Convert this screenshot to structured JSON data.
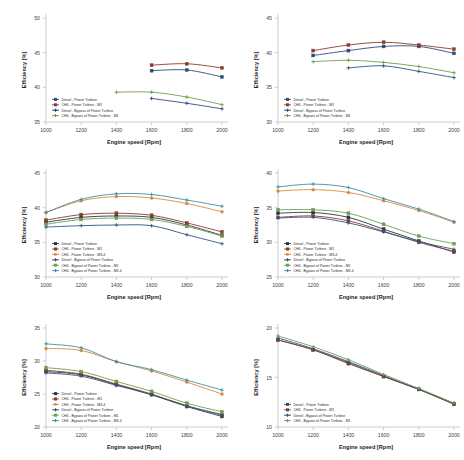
{
  "figure": {
    "background": "#ffffff",
    "panel_count": 6,
    "shared_xlabel": "Engine speed [Rpm]",
    "shared_ylabel": "Efficiency [%]",
    "x_ticks": [
      1000,
      1200,
      1400,
      1600,
      1800,
      2000
    ],
    "series_colors": {
      "diesel_power_turbine": "#2f4a7c",
      "ch4_power_turbine_m1": "#8c3a2b",
      "ch4_power_turbine_m34": "#d98a3a",
      "diesel_bypass": "#31567f",
      "ch4_bypass_m1": "#6f9e4c",
      "ch4_bypass_m34": "#3f8fa8",
      "dark_navy": "#22364f"
    }
  },
  "chart_data": [
    {
      "id": "panel-1",
      "position": "top-left",
      "type": "line",
      "title": "",
      "xlabel": "Engine speed [Rpm]",
      "ylabel": "Efficiency [%]",
      "xlim": [
        1000,
        2000
      ],
      "ylim": [
        35,
        50
      ],
      "x_ticks": [
        1000,
        1200,
        1400,
        1600,
        1800,
        2000
      ],
      "y_ticks": [
        35,
        40,
        45,
        50
      ],
      "grid": false,
      "legend_position": "lower-left",
      "series": [
        {
          "name": "Diesel - Power Turbine",
          "color": "#2f4a7c",
          "marker": "square",
          "x": [
            1600,
            1800,
            2000
          ],
          "values": [
            42.4,
            42.5,
            41.5
          ]
        },
        {
          "name": "CH4 - Power Turbine - M1",
          "color": "#8c3a2b",
          "marker": "square",
          "x": [
            1600,
            1800,
            2000
          ],
          "values": [
            43.2,
            43.4,
            42.8
          ]
        },
        {
          "name": "Diesel - Bypass of Power Turbine",
          "color": "#2f4a7c",
          "marker": "cross",
          "x": [
            1600,
            1800,
            2000
          ],
          "values": [
            38.4,
            37.7,
            36.9
          ]
        },
        {
          "name": "CH4 - Bypass of Power Turbine - M1",
          "color": "#6f9e4c",
          "marker": "cross",
          "x": [
            1400,
            1600,
            1800,
            2000
          ],
          "values": [
            39.3,
            39.3,
            38.6,
            37.5
          ]
        }
      ]
    },
    {
      "id": "panel-2",
      "position": "top-right",
      "type": "line",
      "title": "",
      "xlabel": "Engine speed [Rpm]",
      "ylabel": "Efficiency [%]",
      "xlim": [
        1000,
        2000
      ],
      "ylim": [
        30,
        45
      ],
      "x_ticks": [
        1000,
        1200,
        1400,
        1600,
        1800,
        2000
      ],
      "y_ticks": [
        30,
        35,
        40,
        45
      ],
      "grid": false,
      "legend_position": "lower-left",
      "series": [
        {
          "name": "Diesel - Power Turbine",
          "color": "#2f4a7c",
          "marker": "square",
          "x": [
            1200,
            1400,
            1600,
            1800,
            2000
          ],
          "values": [
            39.6,
            40.3,
            40.9,
            40.9,
            39.9
          ]
        },
        {
          "name": "CH4 - Power Turbine - M1",
          "color": "#8c3a2b",
          "marker": "square",
          "x": [
            1200,
            1400,
            1600,
            1800,
            2000
          ],
          "values": [
            40.3,
            41.1,
            41.5,
            41.1,
            40.5
          ]
        },
        {
          "name": "Diesel - Bypass of Power Turbine",
          "color": "#31567f",
          "marker": "cross",
          "x": [
            1400,
            1600,
            1800,
            2000
          ],
          "values": [
            37.8,
            38.1,
            37.3,
            36.4
          ]
        },
        {
          "name": "CH4 - Bypass of Power Turbine - M1",
          "color": "#6f9e4c",
          "marker": "cross",
          "x": [
            1200,
            1400,
            1600,
            1800,
            2000
          ],
          "values": [
            38.7,
            38.9,
            38.6,
            38.0,
            37.1
          ]
        }
      ]
    },
    {
      "id": "panel-3",
      "position": "middle-left",
      "type": "line",
      "title": "",
      "xlabel": "Engine speed [Rpm]",
      "ylabel": "Efficiency [%]",
      "xlim": [
        1000,
        2000
      ],
      "ylim": [
        30,
        45
      ],
      "x_ticks": [
        1000,
        1200,
        1400,
        1600,
        1800,
        2000
      ],
      "y_ticks": [
        30,
        35,
        40,
        45
      ],
      "grid": false,
      "legend_position": "lower-left",
      "series": [
        {
          "name": "Diesel - Power Turbine",
          "color": "#22364f",
          "marker": "square",
          "x": [
            1000,
            1200,
            1400,
            1600,
            1800,
            2000
          ],
          "values": [
            37.9,
            38.6,
            38.8,
            38.6,
            37.5,
            36.0
          ]
        },
        {
          "name": "CH4 - Power Turbine - M1",
          "color": "#8c3a2b",
          "marker": "square",
          "x": [
            1000,
            1200,
            1400,
            1600,
            1800,
            2000
          ],
          "values": [
            38.2,
            39.0,
            39.2,
            38.9,
            37.8,
            36.5
          ]
        },
        {
          "name": "CH4 - Power Turbine - M3-4",
          "color": "#d98a3a",
          "marker": "circle",
          "x": [
            1000,
            1200,
            1400,
            1600,
            1800,
            2000
          ],
          "values": [
            39.3,
            41.0,
            41.6,
            41.4,
            40.6,
            39.4
          ]
        },
        {
          "name": "Diesel - Bypass of Power Turbine",
          "color": "#31567f",
          "marker": "cross",
          "x": [
            1000,
            1200,
            1400,
            1600,
            1800,
            2000
          ],
          "values": [
            37.2,
            37.4,
            37.5,
            37.4,
            36.1,
            34.8
          ]
        },
        {
          "name": "CH4 - Bypass of Power Turbine - M1",
          "color": "#6f9e4c",
          "marker": "square",
          "x": [
            1000,
            1200,
            1400,
            1600,
            1800,
            2000
          ],
          "values": [
            37.6,
            38.3,
            38.5,
            38.3,
            37.3,
            35.9
          ]
        },
        {
          "name": "CH4 - Bypass of Power Turbine - M3-4",
          "color": "#3f8fa8",
          "marker": "cross",
          "x": [
            1000,
            1200,
            1400,
            1600,
            1800,
            2000
          ],
          "values": [
            39.3,
            41.2,
            42.0,
            41.9,
            41.1,
            40.2
          ]
        }
      ]
    },
    {
      "id": "panel-4",
      "position": "middle-right",
      "type": "line",
      "title": "",
      "xlabel": "Engine speed [Rpm]",
      "ylabel": "Efficiency [%]",
      "xlim": [
        1000,
        2000
      ],
      "ylim": [
        25,
        40
      ],
      "x_ticks": [
        1000,
        1200,
        1400,
        1600,
        1800,
        2000
      ],
      "y_ticks": [
        25,
        30,
        35,
        40
      ],
      "grid": false,
      "legend_position": "lower-left",
      "series": [
        {
          "name": "Diesel - Power Turbine",
          "color": "#22364f",
          "marker": "square",
          "x": [
            1000,
            1200,
            1400,
            1600,
            1800,
            2000
          ],
          "values": [
            34.2,
            34.3,
            33.6,
            31.9,
            30.2,
            28.6
          ]
        },
        {
          "name": "CH4 - Power Turbine - M1",
          "color": "#8c3a2b",
          "marker": "square",
          "x": [
            1000,
            1200,
            1400,
            1600,
            1800,
            2000
          ],
          "values": [
            33.6,
            33.8,
            33.1,
            31.6,
            30.0,
            28.7
          ]
        },
        {
          "name": "CH4 - Power Turbine - M3-4",
          "color": "#d98a3a",
          "marker": "circle",
          "x": [
            1000,
            1200,
            1400,
            1600,
            1800,
            2000
          ],
          "values": [
            37.4,
            37.6,
            37.2,
            36.0,
            34.6,
            32.9
          ]
        },
        {
          "name": "Diesel - Bypass of Power Turbine",
          "color": "#31567f",
          "marker": "cross",
          "x": [
            1000,
            1200,
            1400,
            1600,
            1800,
            2000
          ],
          "values": [
            33.5,
            33.6,
            32.8,
            31.5,
            30.1,
            29.0
          ]
        },
        {
          "name": "CH4 - Bypass of Power Turbine - M1",
          "color": "#6f9e4c",
          "marker": "square",
          "x": [
            1000,
            1200,
            1400,
            1600,
            1800,
            2000
          ],
          "values": [
            34.7,
            34.7,
            34.2,
            32.6,
            30.9,
            29.8
          ]
        },
        {
          "name": "CH4 - Bypass of Power Turbine - M3-4",
          "color": "#3f8fa8",
          "marker": "cross",
          "x": [
            1000,
            1200,
            1400,
            1600,
            1800,
            2000
          ],
          "values": [
            38.0,
            38.4,
            37.9,
            36.3,
            34.8,
            33.0
          ]
        }
      ]
    },
    {
      "id": "panel-5",
      "position": "bottom-left",
      "type": "line",
      "title": "",
      "xlabel": "Engine speed [Rpm]",
      "ylabel": "Efficiency [%]",
      "xlim": [
        1000,
        2000
      ],
      "ylim": [
        20,
        35
      ],
      "x_ticks": [
        1000,
        1200,
        1400,
        1600,
        1800,
        2000
      ],
      "y_ticks": [
        20,
        25,
        30,
        35
      ],
      "grid": false,
      "legend_position": "lower-left",
      "series": [
        {
          "name": "Diesel - Power Turbine",
          "color": "#22364f",
          "marker": "square",
          "x": [
            1000,
            1200,
            1400,
            1600,
            1800,
            2000
          ],
          "values": [
            28.4,
            27.9,
            26.4,
            24.9,
            23.1,
            21.6
          ]
        },
        {
          "name": "CH4 - Power Turbine - M1",
          "color": "#8c3a2b",
          "marker": "square",
          "x": [
            1000,
            1200,
            1400,
            1600,
            1800,
            2000
          ],
          "values": [
            28.6,
            28.0,
            26.5,
            25.0,
            23.2,
            21.8
          ]
        },
        {
          "name": "CH4 - Power Turbine - M3-4",
          "color": "#d98a3a",
          "marker": "circle",
          "x": [
            1000,
            1200,
            1400,
            1600,
            1800,
            2000
          ],
          "values": [
            31.9,
            31.6,
            29.9,
            28.5,
            26.8,
            25.0
          ]
        },
        {
          "name": "Diesel - Bypass of Power Turbine",
          "color": "#31567f",
          "marker": "cross",
          "x": [
            1000,
            1200,
            1400,
            1600,
            1800,
            2000
          ],
          "values": [
            28.2,
            27.7,
            26.3,
            24.9,
            23.2,
            21.9
          ]
        },
        {
          "name": "CH4 - Bypass of Power Turbine - M1",
          "color": "#6f9e4c",
          "marker": "square",
          "x": [
            1000,
            1200,
            1400,
            1600,
            1800,
            2000
          ],
          "values": [
            29.0,
            28.4,
            26.9,
            25.4,
            23.6,
            22.3
          ]
        },
        {
          "name": "CH4 - Bypass of Power Turbine - M3-4",
          "color": "#3f8fa8",
          "marker": "cross",
          "x": [
            1000,
            1200,
            1400,
            1600,
            1800,
            2000
          ],
          "values": [
            32.6,
            32.0,
            29.9,
            28.7,
            27.1,
            25.6
          ]
        }
      ]
    },
    {
      "id": "panel-6",
      "position": "bottom-right",
      "type": "line",
      "title": "",
      "xlabel": "Engine speed [Rpm]",
      "ylabel": "Efficiency [%]",
      "xlim": [
        1000,
        2000
      ],
      "ylim": [
        10,
        20
      ],
      "x_ticks": [
        1000,
        1200,
        1400,
        1600,
        1800,
        2000
      ],
      "y_ticks": [
        10,
        15,
        20
      ],
      "grid": false,
      "legend_position": "lower-left",
      "series": [
        {
          "name": "Diesel - Power Turbine",
          "color": "#2f4a7c",
          "marker": "square",
          "x": [
            1000,
            1200,
            1400,
            1600,
            1800,
            2000
          ],
          "values": [
            18.8,
            17.8,
            16.5,
            15.1,
            13.8,
            12.3
          ]
        },
        {
          "name": "CH4 - Power Turbine - M1",
          "color": "#8c3a2b",
          "marker": "square",
          "x": [
            1000,
            1200,
            1400,
            1600,
            1800,
            2000
          ],
          "values": [
            18.8,
            17.8,
            16.4,
            15.1,
            13.8,
            12.3
          ]
        },
        {
          "name": "Diesel - Bypass of Power Turbine",
          "color": "#31567f",
          "marker": "cross",
          "x": [
            1000,
            1200,
            1400,
            1600,
            1800,
            2000
          ],
          "values": [
            19.0,
            17.9,
            16.6,
            15.2,
            13.8,
            12.4
          ]
        },
        {
          "name": "CH4 - Bypass of Power Turbine - M1",
          "color": "#6f9e4c",
          "marker": "cross",
          "x": [
            1000,
            1200,
            1400,
            1600,
            1800,
            2000
          ],
          "values": [
            19.2,
            18.1,
            16.8,
            15.3,
            13.9,
            12.4
          ]
        }
      ]
    }
  ]
}
